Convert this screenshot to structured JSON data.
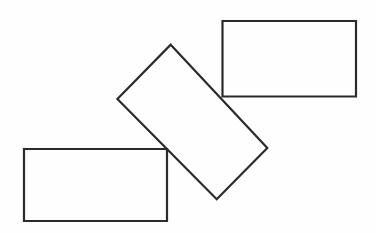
{
  "canvas": {
    "width": 376,
    "height": 233,
    "background_color": "#fefefe",
    "description": "Line drawing of three overlapping rectangles"
  },
  "style": {
    "stroke_color": "#2b2b2b",
    "stroke_width": 2.2,
    "fill": "none"
  },
  "chart_data": {
    "type": "diagram",
    "title": "",
    "xlabel": "",
    "ylabel": "",
    "shapes": [
      {
        "name": "rectangle-top-right",
        "kind": "rectangle",
        "orientation": "axis-aligned",
        "rotation_deg": 0,
        "x": 222.5,
        "y": 21,
        "width": 133.5,
        "height": 75.5,
        "points": [
          [
            222.5,
            21
          ],
          [
            356,
            21
          ],
          [
            356,
            96.5
          ],
          [
            222.5,
            96.5
          ]
        ],
        "path": "M 222.5 21 L 356 21 L 356 96.5 L 222.5 96.5 Z"
      },
      {
        "name": "rectangle-bottom-left",
        "kind": "rectangle",
        "orientation": "axis-aligned",
        "rotation_deg": 0,
        "x": 24,
        "y": 149,
        "width": 143,
        "height": 72,
        "points": [
          [
            24,
            149
          ],
          [
            167,
            149
          ],
          [
            167,
            221
          ],
          [
            24,
            221
          ]
        ],
        "path": "M 24 149 L 167 149 L 167 221 L 24 221 Z"
      },
      {
        "name": "rectangle-rotated-center",
        "kind": "rectangle",
        "orientation": "rotated",
        "rotation_deg": 47,
        "points": [
          [
            170.7,
            44.7
          ],
          [
            267.3,
            148.0
          ],
          [
            216.7,
            199.3
          ],
          [
            117.4,
            99.0
          ]
        ],
        "path": "M 170.7 44.7 L 267.3 148.0 L 216.7 199.3 L 117.4 99.0 Z"
      }
    ],
    "shape_count": 3,
    "overlaps": [
      "rotated rectangle crosses the lower-left corner region of the top-right rectangle",
      "rotated rectangle crosses the upper-right corner region of the bottom-left rectangle"
    ]
  }
}
